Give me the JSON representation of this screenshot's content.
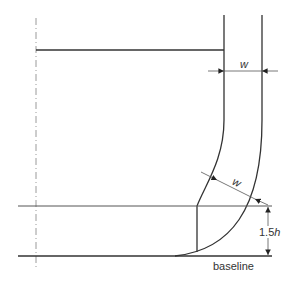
{
  "diagram": {
    "labels": {
      "width_top": "w",
      "width_curve": "w",
      "height_prefix": "1.5",
      "height_var": "h",
      "baseline": "baseline"
    },
    "colors": {
      "line": "#333333",
      "centerline": "#999999",
      "background": "#ffffff"
    }
  }
}
